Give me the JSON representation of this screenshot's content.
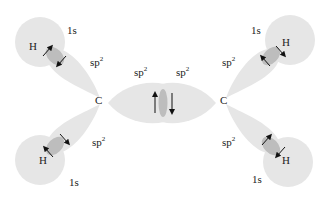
{
  "diagram": {
    "colors": {
      "orbital_fill": "#e6e6e6",
      "overlap_fill": "#bdbdbd",
      "text": "#222222",
      "arrow": "#111111"
    },
    "atoms": {
      "carbon_left": "C",
      "carbon_right": "C",
      "hydrogen_top_left": "H",
      "hydrogen_bottom_left": "H",
      "hydrogen_top_right": "H",
      "hydrogen_bottom_right": "H"
    },
    "labels": {
      "s_top_left": "1s",
      "s_bottom_left": "1s",
      "s_top_right": "1s",
      "s_bottom_right": "1s",
      "sp_base": "sp",
      "sp_sup": "2"
    },
    "orbital_labels": [
      {
        "id": "sp2-top-left",
        "base": "sp",
        "sup": "2"
      },
      {
        "id": "sp2-bottom-left",
        "base": "sp",
        "sup": "2"
      },
      {
        "id": "sp2-center-left",
        "base": "sp",
        "sup": "2"
      },
      {
        "id": "sp2-center-right",
        "base": "sp",
        "sup": "2"
      },
      {
        "id": "sp2-top-right",
        "base": "sp",
        "sup": "2"
      },
      {
        "id": "sp2-bottom-right",
        "base": "sp",
        "sup": "2"
      }
    ]
  }
}
